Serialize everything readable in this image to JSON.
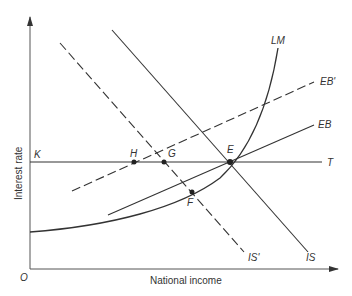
{
  "diagram": {
    "type": "IS-LM-EB diagram",
    "axes": {
      "x_label": "National income",
      "y_label": "Interest rate",
      "origin_label": "O"
    },
    "curves": [
      {
        "id": "IS",
        "label": "IS",
        "style": "solid"
      },
      {
        "id": "IS_prime",
        "label": "IS'",
        "style": "dashed"
      },
      {
        "id": "LM",
        "label": "LM",
        "style": "solid"
      },
      {
        "id": "EB",
        "label": "EB",
        "style": "solid"
      },
      {
        "id": "EB_prime",
        "label": "EB'",
        "style": "dashed"
      },
      {
        "id": "KT",
        "label_left": "K",
        "label_right": "T",
        "style": "solid"
      }
    ],
    "points": [
      {
        "id": "E",
        "label": "E"
      },
      {
        "id": "F",
        "label": "F"
      },
      {
        "id": "G",
        "label": "G"
      },
      {
        "id": "H",
        "label": "H"
      }
    ],
    "colors": {
      "line": "#333333",
      "axis": "#555555",
      "background": "#ffffff"
    }
  }
}
